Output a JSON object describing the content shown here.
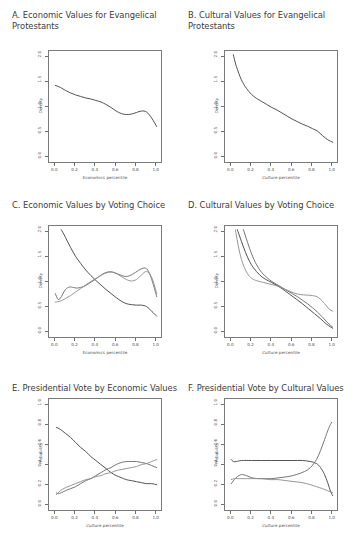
{
  "figure": {
    "background": "#ffffff",
    "panel_border_color": "#7a7a7a",
    "text_color": "#3b3b3b"
  },
  "panels": [
    {
      "id": "A",
      "title": "A. Economic Values for Evangelical\nProtestants",
      "xlabel": "Economics percentile",
      "ylabel": "Density",
      "xticks": [
        "0.0",
        "0.2",
        "0.4",
        "0.6",
        "0.8",
        "1.0"
      ],
      "yticks": [
        "0.0",
        "0.5",
        "1.0",
        "1.5",
        "2.0"
      ]
    },
    {
      "id": "B",
      "title": "B. Cultural Values for Evangelical\nProtestants",
      "xlabel": "Culture percentile",
      "ylabel": "Density",
      "xticks": [
        "0.0",
        "0.2",
        "0.4",
        "0.6",
        "0.8",
        "1.0"
      ],
      "yticks": [
        "0.0",
        "0.5",
        "1.0",
        "1.5",
        "2.0"
      ]
    },
    {
      "id": "C",
      "title": "C. Economic Values by Voting Choice",
      "xlabel": "Economics percentile",
      "ylabel": "Density",
      "xticks": [
        "0.0",
        "0.2",
        "0.4",
        "0.6",
        "0.8",
        "1.0"
      ],
      "yticks": [
        "0.0",
        "0.5",
        "1.0",
        "1.5",
        "2.0"
      ]
    },
    {
      "id": "D",
      "title": "D. Cultural Values by Voting Choice",
      "xlabel": "Culture percentile",
      "ylabel": "Density",
      "xticks": [
        "0.0",
        "0.2",
        "0.4",
        "0.6",
        "0.8",
        "1.0"
      ],
      "yticks": [
        "0.0",
        "0.5",
        "1.0",
        "1.5",
        "2.0"
      ]
    },
    {
      "id": "E",
      "title": "E. Presidential Vote by Economic Values",
      "xlabel": "Culture percentile",
      "ylabel": "Probability",
      "xticks": [
        "0.0",
        "0.2",
        "0.4",
        "0.6",
        "0.8",
        "1.0"
      ],
      "yticks": [
        "0.0",
        "0.2",
        "0.4",
        "0.6",
        "0.8",
        "1.0"
      ]
    },
    {
      "id": "F",
      "title": "F. Presidential Vote by Cultural Values",
      "xlabel": "Culture percentile",
      "ylabel": "Probability",
      "xticks": [
        "0.0",
        "0.2",
        "0.4",
        "0.6",
        "0.8",
        "1.0"
      ],
      "yticks": [
        "0.0",
        "0.2",
        "0.4",
        "0.6",
        "0.8",
        "1.0"
      ]
    }
  ],
  "chart_data": [
    {
      "panel": "A",
      "type": "line",
      "title": "A. Economic Values for Evangelical Protestants",
      "xlabel": "Economics percentile",
      "ylabel": "Density",
      "xlim": [
        0.0,
        1.0
      ],
      "ylim": [
        0.0,
        2.0
      ],
      "grid": false,
      "legend": "none",
      "series": [
        {
          "name": "Evangelical Protestants density",
          "color": "#4a4a4a",
          "x": [
            0.0,
            0.05,
            0.1,
            0.15,
            0.2,
            0.25,
            0.3,
            0.35,
            0.4,
            0.45,
            0.5,
            0.55,
            0.6,
            0.65,
            0.7,
            0.75,
            0.8,
            0.85,
            0.9,
            0.95,
            1.0
          ],
          "y": [
            1.44,
            1.4,
            1.34,
            1.29,
            1.25,
            1.22,
            1.19,
            1.17,
            1.14,
            1.11,
            1.06,
            1.0,
            0.93,
            0.88,
            0.86,
            0.87,
            0.9,
            0.93,
            0.91,
            0.79,
            0.62
          ]
        }
      ]
    },
    {
      "panel": "B",
      "type": "line",
      "title": "B. Cultural Values for Evangelical Protestants",
      "xlabel": "Culture percentile",
      "ylabel": "Density",
      "xlim": [
        0.0,
        1.0
      ],
      "ylim": [
        0.0,
        2.0
      ],
      "grid": false,
      "legend": "none",
      "series": [
        {
          "name": "Evangelical Protestants density",
          "color": "#4a4a4a",
          "x": [
            0.02,
            0.05,
            0.1,
            0.15,
            0.2,
            0.25,
            0.3,
            0.35,
            0.4,
            0.45,
            0.5,
            0.55,
            0.6,
            0.65,
            0.7,
            0.75,
            0.8,
            0.85,
            0.9,
            0.95,
            1.0
          ],
          "y": [
            2.05,
            1.82,
            1.55,
            1.38,
            1.26,
            1.18,
            1.12,
            1.06,
            1.0,
            0.95,
            0.89,
            0.83,
            0.77,
            0.72,
            0.67,
            0.63,
            0.58,
            0.53,
            0.44,
            0.36,
            0.31
          ]
        }
      ]
    },
    {
      "panel": "C",
      "type": "line",
      "title": "C. Economic Values by Voting Choice",
      "xlabel": "Economics percentile",
      "ylabel": "Density",
      "xlim": [
        0.0,
        1.0
      ],
      "ylim": [
        0.0,
        2.0
      ],
      "grid": false,
      "legend": "none",
      "series": [
        {
          "name": "curve-1-dark-descending",
          "color": "#4a4a4a",
          "x": [
            0.06,
            0.1,
            0.15,
            0.2,
            0.25,
            0.3,
            0.35,
            0.4,
            0.45,
            0.5,
            0.55,
            0.6,
            0.65,
            0.7,
            0.75,
            0.8,
            0.85,
            0.9,
            0.95,
            1.0
          ],
          "y": [
            2.05,
            1.9,
            1.7,
            1.52,
            1.38,
            1.25,
            1.14,
            1.04,
            0.95,
            0.86,
            0.78,
            0.7,
            0.63,
            0.58,
            0.56,
            0.55,
            0.55,
            0.52,
            0.43,
            0.33
          ]
        },
        {
          "name": "curve-2-mid-gray-bimodal",
          "color": "#6e6e6e",
          "x": [
            0.0,
            0.03,
            0.06,
            0.1,
            0.14,
            0.18,
            0.22,
            0.28,
            0.34,
            0.4,
            0.46,
            0.52,
            0.58,
            0.64,
            0.7,
            0.76,
            0.82,
            0.88,
            0.92,
            0.96,
            1.0
          ],
          "y": [
            0.78,
            0.66,
            0.72,
            0.86,
            0.91,
            0.9,
            0.89,
            0.92,
            0.99,
            1.07,
            1.16,
            1.21,
            1.2,
            1.15,
            1.12,
            1.16,
            1.24,
            1.29,
            1.22,
            1.0,
            0.72
          ]
        },
        {
          "name": "curve-3-light-gray-rising",
          "color": "#8f8f8f",
          "x": [
            0.0,
            0.05,
            0.1,
            0.15,
            0.2,
            0.25,
            0.3,
            0.35,
            0.4,
            0.45,
            0.5,
            0.55,
            0.6,
            0.65,
            0.7,
            0.75,
            0.8,
            0.85,
            0.9,
            0.95,
            1.0
          ],
          "y": [
            0.61,
            0.63,
            0.68,
            0.74,
            0.81,
            0.88,
            0.95,
            1.02,
            1.08,
            1.14,
            1.19,
            1.21,
            1.18,
            1.12,
            1.06,
            1.03,
            1.06,
            1.15,
            1.22,
            1.1,
            0.78
          ]
        }
      ]
    },
    {
      "panel": "D",
      "type": "line",
      "title": "D. Cultural Values by Voting Choice",
      "xlabel": "Culture percentile",
      "ylabel": "Density",
      "xlim": [
        0.0,
        1.0
      ],
      "ylim": [
        0.0,
        2.0
      ],
      "grid": false,
      "legend": "none",
      "series": [
        {
          "name": "curve-1-dark-steep",
          "color": "#4a4a4a",
          "x": [
            0.06,
            0.1,
            0.14,
            0.18,
            0.22,
            0.28,
            0.34,
            0.4,
            0.46,
            0.52,
            0.58,
            0.64,
            0.7,
            0.76,
            0.82,
            0.88,
            0.94,
            1.0
          ],
          "y": [
            2.05,
            1.82,
            1.6,
            1.42,
            1.29,
            1.15,
            1.06,
            1.0,
            0.93,
            0.85,
            0.76,
            0.67,
            0.58,
            0.48,
            0.38,
            0.28,
            0.17,
            0.09
          ]
        },
        {
          "name": "curve-2-mid-gray",
          "color": "#6e6e6e",
          "x": [
            0.12,
            0.16,
            0.2,
            0.25,
            0.3,
            0.35,
            0.4,
            0.45,
            0.5,
            0.55,
            0.6,
            0.65,
            0.7,
            0.75,
            0.8,
            0.85,
            0.9,
            0.95,
            1.0
          ],
          "y": [
            2.05,
            1.8,
            1.57,
            1.35,
            1.2,
            1.1,
            1.02,
            0.96,
            0.9,
            0.84,
            0.78,
            0.72,
            0.65,
            0.58,
            0.5,
            0.41,
            0.31,
            0.2,
            0.11
          ]
        },
        {
          "name": "curve-3-light-gray-flat-tail",
          "color": "#8f8f8f",
          "x": [
            0.04,
            0.07,
            0.1,
            0.14,
            0.18,
            0.22,
            0.26,
            0.32,
            0.38,
            0.44,
            0.5,
            0.56,
            0.62,
            0.68,
            0.74,
            0.8,
            0.86,
            0.92,
            0.96,
            1.0
          ],
          "y": [
            2.05,
            1.72,
            1.46,
            1.25,
            1.12,
            1.06,
            1.03,
            1.0,
            0.97,
            0.94,
            0.89,
            0.84,
            0.79,
            0.76,
            0.75,
            0.74,
            0.7,
            0.58,
            0.48,
            0.43
          ]
        }
      ]
    },
    {
      "panel": "E",
      "type": "line",
      "title": "E. Presidential Vote by Economic Values",
      "xlabel": "Culture percentile",
      "ylabel": "Probability",
      "xlim": [
        0.0,
        1.0
      ],
      "ylim": [
        0.0,
        1.0
      ],
      "grid": false,
      "legend": "none",
      "series": [
        {
          "name": "curve-1-dark-descending",
          "color": "#4a4a4a",
          "x": [
            0.01,
            0.05,
            0.1,
            0.15,
            0.2,
            0.25,
            0.3,
            0.35,
            0.4,
            0.45,
            0.5,
            0.55,
            0.6,
            0.65,
            0.7,
            0.75,
            0.8,
            0.85,
            0.9,
            0.95,
            1.0
          ],
          "y": [
            0.78,
            0.76,
            0.72,
            0.68,
            0.63,
            0.58,
            0.54,
            0.49,
            0.45,
            0.41,
            0.37,
            0.33,
            0.3,
            0.28,
            0.26,
            0.25,
            0.24,
            0.23,
            0.22,
            0.22,
            0.21
          ]
        },
        {
          "name": "curve-2-mid-gray-hump",
          "color": "#6e6e6e",
          "x": [
            0.01,
            0.03,
            0.06,
            0.1,
            0.15,
            0.2,
            0.25,
            0.3,
            0.35,
            0.4,
            0.45,
            0.5,
            0.55,
            0.6,
            0.65,
            0.7,
            0.75,
            0.8,
            0.85,
            0.9,
            0.95,
            1.0
          ],
          "y": [
            0.13,
            0.12,
            0.13,
            0.15,
            0.17,
            0.19,
            0.22,
            0.25,
            0.27,
            0.3,
            0.33,
            0.36,
            0.38,
            0.41,
            0.43,
            0.44,
            0.44,
            0.44,
            0.43,
            0.42,
            0.4,
            0.38
          ]
        },
        {
          "name": "curve-3-light-gray-rising",
          "color": "#8f8f8f",
          "x": [
            0.01,
            0.05,
            0.1,
            0.15,
            0.2,
            0.25,
            0.3,
            0.35,
            0.4,
            0.45,
            0.5,
            0.55,
            0.6,
            0.65,
            0.7,
            0.75,
            0.8,
            0.85,
            0.9,
            0.95,
            1.0
          ],
          "y": [
            0.11,
            0.15,
            0.18,
            0.2,
            0.22,
            0.24,
            0.26,
            0.27,
            0.29,
            0.3,
            0.32,
            0.33,
            0.35,
            0.36,
            0.37,
            0.38,
            0.39,
            0.41,
            0.42,
            0.44,
            0.46
          ]
        }
      ]
    },
    {
      "panel": "F",
      "type": "line",
      "title": "F. Presidential Vote by Cultural Values",
      "xlabel": "Culture percentile",
      "ylabel": "Probability",
      "xlim": [
        0.0,
        1.0
      ],
      "ylim": [
        0.0,
        1.0
      ],
      "grid": false,
      "legend": "none",
      "series": [
        {
          "name": "curve-1-dark-flat-then-drop",
          "color": "#4a4a4a",
          "x": [
            0.0,
            0.02,
            0.05,
            0.1,
            0.2,
            0.3,
            0.4,
            0.5,
            0.6,
            0.7,
            0.78,
            0.84,
            0.88,
            0.92,
            0.95,
            0.98,
            1.0
          ],
          "y": [
            0.46,
            0.44,
            0.44,
            0.45,
            0.45,
            0.45,
            0.45,
            0.45,
            0.45,
            0.45,
            0.44,
            0.42,
            0.38,
            0.31,
            0.23,
            0.14,
            0.1
          ]
        },
        {
          "name": "curve-2-mid-gray-rising-tail",
          "color": "#6e6e6e",
          "x": [
            0.0,
            0.03,
            0.06,
            0.1,
            0.15,
            0.2,
            0.26,
            0.32,
            0.4,
            0.48,
            0.56,
            0.64,
            0.72,
            0.78,
            0.84,
            0.88,
            0.92,
            0.96,
            0.99
          ],
          "y": [
            0.22,
            0.26,
            0.29,
            0.31,
            0.3,
            0.28,
            0.27,
            0.27,
            0.27,
            0.28,
            0.29,
            0.31,
            0.34,
            0.38,
            0.46,
            0.55,
            0.66,
            0.77,
            0.83
          ]
        },
        {
          "name": "curve-3-light-gray-declining",
          "color": "#8f8f8f",
          "x": [
            0.0,
            0.03,
            0.06,
            0.1,
            0.16,
            0.22,
            0.3,
            0.38,
            0.46,
            0.54,
            0.62,
            0.7,
            0.78,
            0.84,
            0.9,
            0.95,
            1.0
          ],
          "y": [
            0.26,
            0.27,
            0.27,
            0.27,
            0.27,
            0.27,
            0.27,
            0.26,
            0.26,
            0.25,
            0.24,
            0.23,
            0.21,
            0.19,
            0.17,
            0.15,
            0.13
          ]
        }
      ]
    }
  ]
}
